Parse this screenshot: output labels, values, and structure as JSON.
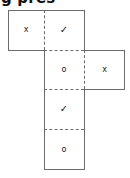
{
  "caption": {
    "text": "g pres",
    "note": "partially cropped heading text at top edge"
  },
  "diagram": {
    "name": "cube-net",
    "type": "net-of-solid",
    "line_color": "#6b6b6b",
    "glyph_color": "#1a1a1a",
    "background": "#ffffff",
    "columns": 3,
    "rows": 4,
    "cells": [
      {
        "id": "cell-r1c1",
        "row": 1,
        "column": 1,
        "symbol": "x",
        "symbol_name": "letter-x",
        "x": 8,
        "y": 10,
        "w": 36,
        "h": 40,
        "borders": {
          "top": "solid",
          "right": "dashed",
          "bottom": "solid",
          "left": "solid"
        }
      },
      {
        "id": "cell-r1c2",
        "row": 1,
        "column": 2,
        "symbol": "✓",
        "symbol_name": "check-mark",
        "x": 44,
        "y": 10,
        "w": 40,
        "h": 40,
        "borders": {
          "top": "solid",
          "right": "solid",
          "bottom": "dashed",
          "left": "dashed"
        }
      },
      {
        "id": "cell-r2c2",
        "row": 2,
        "column": 2,
        "symbol": "o",
        "symbol_name": "letter-o",
        "x": 44,
        "y": 50,
        "w": 40,
        "h": 39,
        "borders": {
          "top": "dashed",
          "right": "dashed",
          "bottom": "dashed",
          "left": "solid"
        }
      },
      {
        "id": "cell-r2c3",
        "row": 2,
        "column": 3,
        "symbol": "x",
        "symbol_name": "letter-x",
        "x": 84,
        "y": 50,
        "w": 41,
        "h": 39,
        "borders": {
          "top": "solid",
          "right": "solid",
          "bottom": "solid",
          "left": "dashed"
        }
      },
      {
        "id": "cell-r3c2",
        "row": 3,
        "column": 2,
        "symbol": "✓",
        "symbol_name": "check-mark",
        "x": 44,
        "y": 89,
        "w": 40,
        "h": 40,
        "borders": {
          "top": "dashed",
          "right": "solid",
          "bottom": "dashed",
          "left": "solid"
        }
      },
      {
        "id": "cell-r4c2",
        "row": 4,
        "column": 2,
        "symbol": "o",
        "symbol_name": "letter-o",
        "x": 44,
        "y": 129,
        "w": 40,
        "h": 41,
        "borders": {
          "top": "dashed",
          "right": "solid",
          "bottom": "solid",
          "left": "solid"
        }
      }
    ]
  }
}
